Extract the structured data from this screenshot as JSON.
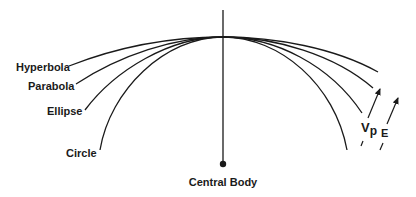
{
  "diagram": {
    "title": "",
    "central_body": {
      "label": "Central Body"
    },
    "orbits": [
      {
        "label": "Hyperbola"
      },
      {
        "label": "Parabola"
      },
      {
        "label": "Ellipse"
      },
      {
        "label": "Circle"
      }
    ],
    "vectors": [
      {
        "label_main": "V",
        "label_sub": "p"
      },
      {
        "label_main": "E"
      }
    ],
    "colors": {
      "line": "#1a1a1a",
      "background": "#ffffff"
    }
  }
}
